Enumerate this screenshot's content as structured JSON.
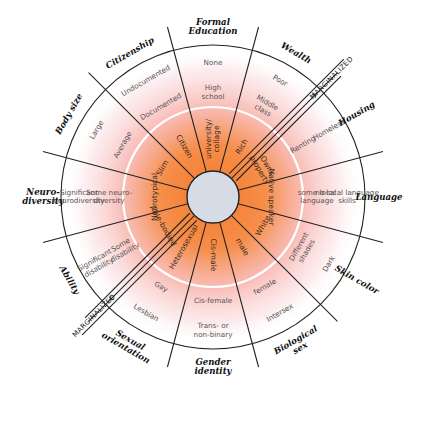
{
  "diagram": {
    "center": {
      "x": 213,
      "y": 197
    },
    "colors": {
      "hub_fill": "#d6dbe6",
      "gradient_inner": "#f58a3a",
      "gradient_mid": "#f7b6a6",
      "gradient_outer": "#ffffff",
      "lines": "#222222",
      "ring": "#ffffff"
    },
    "arrows": {
      "outer_label": "MARGINALIZED",
      "inner_label": "MARGINALIZED"
    },
    "sectors": [
      {
        "category": "Formal Education",
        "category_lines": [
          "Formal",
          "Education"
        ],
        "inner": "university/ collage",
        "inner_lines": [
          "university/",
          "collage"
        ],
        "middle": "High school",
        "middle_lines": [
          "High",
          "school"
        ],
        "outer": "None",
        "outer_lines": [
          "None"
        ]
      },
      {
        "category": "Wealth",
        "category_lines": [
          "Wealth"
        ],
        "inner": "Rich",
        "inner_lines": [
          "Rich"
        ],
        "middle": "Middle class",
        "middle_lines": [
          "Middle",
          "class"
        ],
        "outer": "Poor",
        "outer_lines": [
          "Poor"
        ]
      },
      {
        "category": "Housing",
        "category_lines": [
          "Housing"
        ],
        "inner": "Owns property",
        "inner_lines": [
          "Owns",
          "property"
        ],
        "middle": "Renting",
        "middle_lines": [
          "Renting"
        ],
        "outer": "Homeless",
        "outer_lines": [
          "Homeless"
        ]
      },
      {
        "category": "Language",
        "category_lines": [
          "Language"
        ],
        "inner": "Native speaker",
        "inner_lines": [
          "Native speaker"
        ],
        "middle": "some local language",
        "middle_lines": [
          "some local",
          "language"
        ],
        "outer": "no local language skills",
        "outer_lines": [
          "no local language",
          "skills"
        ]
      },
      {
        "category": "Skin color",
        "category_lines": [
          "Skin color"
        ],
        "inner": "White",
        "inner_lines": [
          "White"
        ],
        "middle": "Different shades",
        "middle_lines": [
          "Different",
          "shades"
        ],
        "outer": "Dark",
        "outer_lines": [
          "Dark"
        ]
      },
      {
        "category": "Biological sex",
        "category_lines": [
          "Biological",
          "sex"
        ],
        "inner": "male",
        "inner_lines": [
          "male"
        ],
        "middle": "female",
        "middle_lines": [
          "female"
        ],
        "outer": "Intersex",
        "outer_lines": [
          "Intersex"
        ]
      },
      {
        "category": "Gender identity",
        "category_lines": [
          "Gender",
          "identity"
        ],
        "inner": "Cis-male",
        "inner_lines": [
          "Cis-male"
        ],
        "middle": "Cis-female",
        "middle_lines": [
          "Cis-female"
        ],
        "outer": "Trans- or non-binary",
        "outer_lines": [
          "Trans- or",
          "non-binary"
        ]
      },
      {
        "category": "Sexual orientation",
        "category_lines": [
          "Sexual",
          "orientation"
        ],
        "inner": "Heterosexual",
        "inner_lines": [
          "Heterosexual"
        ],
        "middle": "Gay",
        "middle_lines": [
          "Gay"
        ],
        "outer": "Lesbian",
        "outer_lines": [
          "Lesbian"
        ]
      },
      {
        "category": "Ability",
        "category_lines": [
          "Ability"
        ],
        "inner": "Able-bodied",
        "inner_lines": [
          "Able-bodied"
        ],
        "middle": "Some disability",
        "middle_lines": [
          "Some",
          "disability"
        ],
        "outer": "Significant disability",
        "outer_lines": [
          "Significant",
          "disability"
        ]
      },
      {
        "category": "Neuro-diversity",
        "category_lines": [
          "Neuro-",
          "diversity"
        ],
        "inner": "Neurotypical",
        "inner_lines": [
          "Neurotypical"
        ],
        "middle": "Some neuro-diversity",
        "middle_lines": [
          "Some neuro-",
          "diversity"
        ],
        "outer": "Significant neurodiversity",
        "outer_lines": [
          "Significant",
          "neurodiversity"
        ]
      },
      {
        "category": "Body size",
        "category_lines": [
          "Body size"
        ],
        "inner": "Slim",
        "inner_lines": [
          "Slim"
        ],
        "middle": "Average",
        "middle_lines": [
          "Average"
        ],
        "outer": "Large",
        "outer_lines": [
          "Large"
        ]
      },
      {
        "category": "Citizenship",
        "category_lines": [
          "Citizenship"
        ],
        "inner": "Citizen",
        "inner_lines": [
          "Citizen"
        ],
        "middle": "Documented",
        "middle_lines": [
          "Documented"
        ],
        "outer": "Undocumented",
        "outer_lines": [
          "Undocumented"
        ]
      }
    ]
  }
}
